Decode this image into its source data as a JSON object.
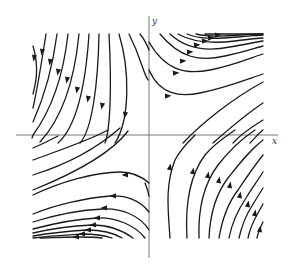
{
  "figure": {
    "type": "phase-portrait",
    "axes": {
      "x_label": "x",
      "y_label": "y",
      "origin_px": [
        149,
        135
      ],
      "x_axis_px": [
        16,
        278
      ],
      "y_axis_px": [
        16,
        258
      ]
    },
    "colors": {
      "stream": "#1a1a1a",
      "axis": "#777777",
      "background": "#ffffff"
    }
  },
  "streamlines": {
    "top_left": [
      {
        "d": "M33,46 C40,70 35,85 33,94",
        "arrow": [
          34,
          58
        ],
        "dir": "down"
      },
      {
        "d": "M46,34 C42,60 38,85 33,108",
        "arrow": [
          42,
          52
        ],
        "dir": "down"
      },
      {
        "d": "M57,34 C53,65 45,95 33,122",
        "arrow": [
          50,
          62
        ],
        "dir": "down"
      },
      {
        "d": "M68,34 C64,70 55,105 33,135 L32,138",
        "arrow": [
          58,
          72
        ],
        "dir": "down"
      },
      {
        "d": "M79,34 C75,75 65,115 40,142",
        "arrow": [
          67,
          80
        ],
        "dir": "down"
      },
      {
        "d": "M89,34 C86,80 78,125 58,143",
        "arrow": [
          77,
          90
        ],
        "dir": "down"
      },
      {
        "d": "M99,34 C98,85 92,130 80,143",
        "arrow": [
          88,
          99
        ],
        "dir": "down"
      },
      {
        "d": "M109,34 C112,90 110,130 105,143",
        "arrow": [
          102,
          106
        ],
        "dir": "down"
      },
      {
        "d": "M119,34 C130,70 130,120 115,143",
        "arrow": [
          125,
          115
        ],
        "dir": "down"
      },
      {
        "d": "M129,34 C142,60 142,70 148,80",
        "arrow": null,
        "dir": "down"
      },
      {
        "d": "M140,34 C145,40 147,45 149,50",
        "arrow": null,
        "dir": "down"
      }
    ],
    "top_right": [
      {
        "d": "M149,70 C160,95 180,97 200,93 C225,88 245,80 263,74",
        "arrow": [
          168,
          96
        ],
        "dir": "right"
      },
      {
        "d": "M149,42 C165,70 185,75 210,70 C235,65 250,58 263,54",
        "arrow": [
          176,
          73
        ],
        "dir": "right"
      },
      {
        "d": "M160,34 C180,58 200,62 225,56 C245,52 255,48 263,46",
        "arrow": [
          183,
          61
        ],
        "dir": "right"
      },
      {
        "d": "M170,34 C185,48 205,52 230,47 C248,44 256,42 263,41",
        "arrow": [
          190,
          52
        ],
        "dir": "right"
      },
      {
        "d": "M178,34 C192,42 210,44 235,41 C250,39 258,38 263,38",
        "arrow": [
          197,
          45
        ],
        "dir": "right"
      },
      {
        "d": "M187,34 C198,39 213,39 238,37 C252,36 258,35 263,35",
        "arrow": [
          205,
          41
        ],
        "dir": "right"
      },
      {
        "d": "M196,34 C205,36 218,37 240,35 C252,34 258,34 263,34",
        "arrow": [
          211,
          38
        ],
        "dir": "right"
      },
      {
        "d": "M205,34 C215,34 230,34 263,34",
        "arrow": [
          218,
          35
        ],
        "dir": "right"
      }
    ],
    "bottom_right_diag": [
      {
        "d": "M183,143 C200,125 230,100 263,82",
        "arrow": null,
        "dir": "up"
      },
      {
        "d": "M213,143 C230,128 245,115 263,103",
        "arrow": null,
        "dir": "up"
      },
      {
        "d": "M233,143 C240,135 250,128 263,120",
        "arrow": null,
        "dir": "up"
      },
      {
        "d": "M250,143 C255,138 258,134 263,130",
        "arrow": null,
        "dir": "up"
      }
    ],
    "bottom_right": [
      {
        "d": "M170,238 C168,210 165,185 175,160 C180,150 188,142 195,135",
        "arrow": [
          170,
          167
        ],
        "dir": "up"
      },
      {
        "d": "M187,238 C185,205 190,175 205,155 C215,143 225,137 235,130",
        "arrow": [
          193,
          171
        ],
        "dir": "up"
      },
      {
        "d": "M199,238 C198,210 203,185 218,165 C228,152 240,140 255,130",
        "arrow": [
          208,
          175
        ],
        "dir": "up"
      },
      {
        "d": "M209,238 C210,215 215,195 228,178 C240,163 250,150 263,140",
        "arrow": [
          219,
          180
        ],
        "dir": "up"
      },
      {
        "d": "M219,238 C222,220 228,203 238,190 C248,175 255,165 263,155",
        "arrow": [
          230,
          185
        ],
        "dir": "up"
      },
      {
        "d": "M229,238 C232,222 238,210 246,198 C252,188 258,180 263,172",
        "arrow": [
          240,
          195
        ],
        "dir": "up"
      },
      {
        "d": "M239,238 C242,225 246,215 252,206 C256,199 260,193 263,188",
        "arrow": [
          248,
          204
        ],
        "dir": "up"
      },
      {
        "d": "M248,238 C250,228 254,220 258,213 C260,209 262,206 263,204",
        "arrow": [
          255,
          213
        ],
        "dir": "up"
      },
      {
        "d": "M257,238 C258,232 260,228 263,222",
        "arrow": [
          260,
          229
        ],
        "dir": "up"
      }
    ],
    "bottom_left_diag": [
      {
        "d": "M33,160 C60,150 90,140 108,130",
        "arrow": null,
        "dir": "down"
      },
      {
        "d": "M33,175 C65,165 95,150 120,128",
        "arrow": null,
        "dir": "down"
      },
      {
        "d": "M33,190 C70,175 110,155 128,131",
        "arrow": null,
        "dir": "down"
      },
      {
        "d": "M33,148 C45,143 52,139 58,136",
        "arrow": null,
        "dir": "down"
      }
    ],
    "bottom_left": [
      {
        "d": "M149,183 C140,175 130,172 120,172 C95,172 60,182 33,195",
        "arrow": [
          125,
          175
        ],
        "dir": "left"
      },
      {
        "d": "M149,212 C140,200 125,195 110,196 C85,198 55,205 33,214",
        "arrow": [
          113,
          196
        ],
        "dir": "left"
      },
      {
        "d": "M149,230 C140,215 120,208 103,209 C80,210 55,215 33,222",
        "arrow": [
          104,
          208
        ],
        "dir": "left"
      },
      {
        "d": "M145,238 C135,225 115,217 97,218 C75,219 52,224 33,229",
        "arrow": [
          97,
          218
        ],
        "dir": "left"
      },
      {
        "d": "M133,238 C122,230 108,225 92,225 C72,226 50,229 33,233",
        "arrow": [
          93,
          225
        ],
        "dir": "left"
      },
      {
        "d": "M122,238 C112,232 100,230 87,230 C70,231 50,233 33,236",
        "arrow": [
          88,
          230
        ],
        "dir": "left"
      },
      {
        "d": "M112,238 C103,235 93,234 82,234 C67,235 50,236 33,238",
        "arrow": [
          82,
          234
        ],
        "dir": "left"
      },
      {
        "d": "M102,238 C95,237 87,237 77,237 C62,237 48,238 40,238",
        "arrow": [
          76,
          237
        ],
        "dir": "left"
      },
      {
        "d": "M149,196 C148,190 146,186 145,183",
        "arrow": null,
        "dir": "left"
      }
    ]
  }
}
